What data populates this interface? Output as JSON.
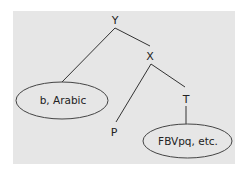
{
  "diagram": {
    "type": "tree",
    "background_color": "#e6e6e6",
    "line_color": "#333333",
    "nodes": {
      "y": {
        "label": "Y"
      },
      "x": {
        "label": "X"
      },
      "p": {
        "label": "P"
      },
      "t": {
        "label": "T"
      },
      "b_arabic": {
        "label": "b, Arabic"
      },
      "fbvpq": {
        "label": "FBVpq, etc."
      }
    },
    "edges": [
      {
        "from": "Y",
        "to": "b, Arabic"
      },
      {
        "from": "Y",
        "to": "X"
      },
      {
        "from": "X",
        "to": "P"
      },
      {
        "from": "X",
        "to": "T"
      },
      {
        "from": "T",
        "to": "FBVpq, etc."
      }
    ]
  }
}
